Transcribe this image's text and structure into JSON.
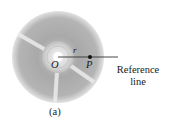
{
  "figure": {
    "caption": "(a)",
    "labels": {
      "origin": "O",
      "point": "P",
      "radius": "r",
      "reference_line": [
        "Reference",
        "line"
      ]
    },
    "colors": {
      "disc_outer": "#9a9a9a",
      "disc_inner": "#b8b8b8",
      "hub": "#d4d4d4",
      "spoke": "#e6e6e6",
      "line": "#333333",
      "text": "#1a1a1a"
    }
  }
}
